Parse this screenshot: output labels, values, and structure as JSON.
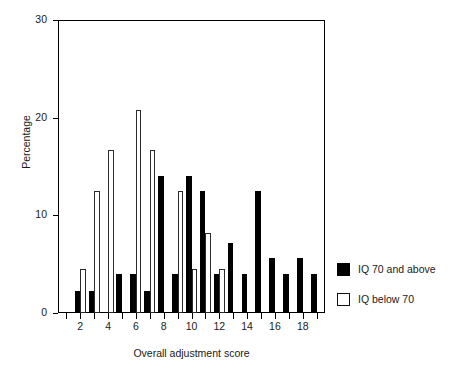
{
  "chart_data": {
    "type": "bar",
    "title": "",
    "xlabel": "Overall adjustment score",
    "ylabel": "Percentage",
    "xlim": [
      0.4,
      19.6
    ],
    "ylim": [
      0,
      30
    ],
    "ytick_labels": [
      "0",
      "10",
      "20",
      "30"
    ],
    "yticks": [
      0,
      10,
      20,
      30
    ],
    "xtick_labels": [
      "2",
      "4",
      "6",
      "8",
      "10",
      "12",
      "14",
      "16",
      "18"
    ],
    "xticks": [
      2,
      4,
      6,
      8,
      10,
      12,
      14,
      16,
      18
    ],
    "grid": false,
    "legend_position": "right-outside",
    "categories": [
      1,
      2,
      3,
      4,
      5,
      6,
      7,
      8,
      9,
      10,
      11,
      12,
      13,
      14,
      15,
      16,
      17,
      18,
      19
    ],
    "series": [
      {
        "name": "IQ 70 and above",
        "color": "#000000",
        "style": "filled",
        "values": [
          0,
          2.3,
          2.3,
          0,
          4.0,
          4.0,
          2.3,
          14.0,
          4.0,
          14.0,
          12.5,
          4.0,
          7.2,
          4.0,
          12.5,
          5.6,
          4.0,
          5.6,
          4.0
        ]
      },
      {
        "name": "IQ below 70",
        "color": "#ffffff",
        "style": "outlined",
        "values": [
          0,
          4.5,
          12.5,
          16.7,
          0,
          20.8,
          16.7,
          0,
          12.5,
          4.5,
          8.2,
          4.5,
          0,
          0,
          0,
          0,
          0,
          0,
          0
        ]
      }
    ]
  },
  "legend": {
    "items": [
      {
        "label": "IQ 70 and above",
        "swatch": "black"
      },
      {
        "label": "IQ below 70",
        "swatch": "white"
      }
    ]
  }
}
